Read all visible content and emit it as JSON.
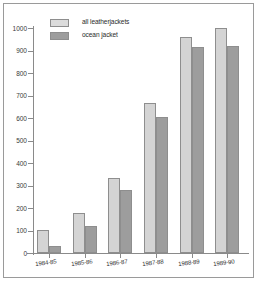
{
  "chart_data": {
    "type": "bar",
    "title": "",
    "subtitle": "",
    "xlabel": "",
    "ylabel": "",
    "categories": [
      "1984-85",
      "1985-86",
      "1986-87",
      "1987-88",
      "1988-89",
      "1989-90"
    ],
    "series": [
      {
        "name": "all leatherjackets",
        "color": "#d4d4d4",
        "values": [
          103,
          180,
          335,
          668,
          962,
          1000
        ]
      },
      {
        "name": "ocean jacket",
        "color": "#9d9d9d",
        "values": [
          33,
          120,
          278,
          603,
          915,
          922
        ]
      }
    ],
    "ylim": [
      0,
      1000
    ],
    "ytick_values": [
      0,
      100,
      200,
      300,
      400,
      500,
      600,
      700,
      800,
      900,
      1000
    ],
    "ytick_labels": [
      "0",
      "100",
      "200",
      "300",
      "400",
      "500",
      "600",
      "700",
      "800",
      "900",
      "1000"
    ],
    "grid": false,
    "legend_position": "top-left",
    "xtick_label_rotation": -7
  },
  "legend": {
    "items": [
      {
        "label": "all leatherjackets",
        "swatch": "light"
      },
      {
        "label": "ocean jacket",
        "swatch": "dark"
      }
    ]
  },
  "colors": {
    "series_light": "#d4d4d4",
    "series_dark": "#9d9d9d",
    "axis": "#8a8a8a",
    "frame": "#9a9a9a",
    "background": "#ffffff",
    "text": "#2b2b2b"
  }
}
